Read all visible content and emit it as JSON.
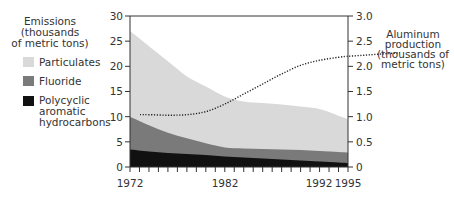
{
  "chart_data": {
    "type": "area",
    "title": "",
    "left_axis_label": [
      "Emissions",
      "(thousands",
      "of metric tons)"
    ],
    "right_axis_label": [
      "Aluminum",
      "production",
      "(thousands of",
      "metric tons)"
    ],
    "xlabel": "",
    "x_ticks": [
      "1972",
      "1982",
      "1992",
      "1995"
    ],
    "left_ticks": [
      "0",
      "5",
      "10",
      "15",
      "20",
      "25",
      "30"
    ],
    "right_ticks": [
      "0",
      "0.5",
      "1.0",
      "1.5",
      "2.0",
      "2.5",
      "3.0"
    ],
    "ylim_left": [
      0,
      30
    ],
    "ylim_right": [
      0,
      3.0
    ],
    "xlim": [
      1972,
      1995
    ],
    "grid": false,
    "legend_position": "left",
    "x": [
      1972,
      1974,
      1976,
      1978,
      1980,
      1982,
      1984,
      1986,
      1988,
      1990,
      1992,
      1994,
      1995
    ],
    "series": [
      {
        "name": "Polycyclic aromatic hydrocarbons",
        "type": "stacked-area",
        "color": "#111111",
        "values": [
          3.5,
          3.1,
          2.8,
          2.6,
          2.4,
          2.1,
          1.9,
          1.7,
          1.5,
          1.3,
          1.1,
          0.9,
          0.8
        ]
      },
      {
        "name": "Fluoride",
        "type": "stacked-area",
        "color": "#7a7a7a",
        "values": [
          6.5,
          5.2,
          4.0,
          3.1,
          2.3,
          1.8,
          1.8,
          1.9,
          2.0,
          2.1,
          2.1,
          2.1,
          2.1
        ]
      },
      {
        "name": "Particulates",
        "type": "stacked-area",
        "color": "#d9d9d9",
        "values": [
          17.0,
          15.7,
          14.2,
          12.3,
          11.3,
          10.1,
          9.3,
          9.1,
          8.9,
          8.6,
          8.3,
          7.2,
          6.6
        ]
      },
      {
        "name": "Aluminum production",
        "type": "line",
        "style": "dotted",
        "axis": "right",
        "color": "#222222",
        "values": [
          1.04,
          1.04,
          1.03,
          1.04,
          1.1,
          1.25,
          1.45,
          1.65,
          1.85,
          2.02,
          2.12,
          2.18,
          2.2
        ]
      }
    ]
  },
  "legend": {
    "items": [
      {
        "label": "Particulates",
        "color": "#d9d9d9"
      },
      {
        "label": "Fluoride",
        "color": "#7a7a7a"
      },
      {
        "label_lines": [
          "Polycyclic",
          "aromatic",
          "hydrocarbons"
        ],
        "color": "#111111"
      }
    ]
  }
}
